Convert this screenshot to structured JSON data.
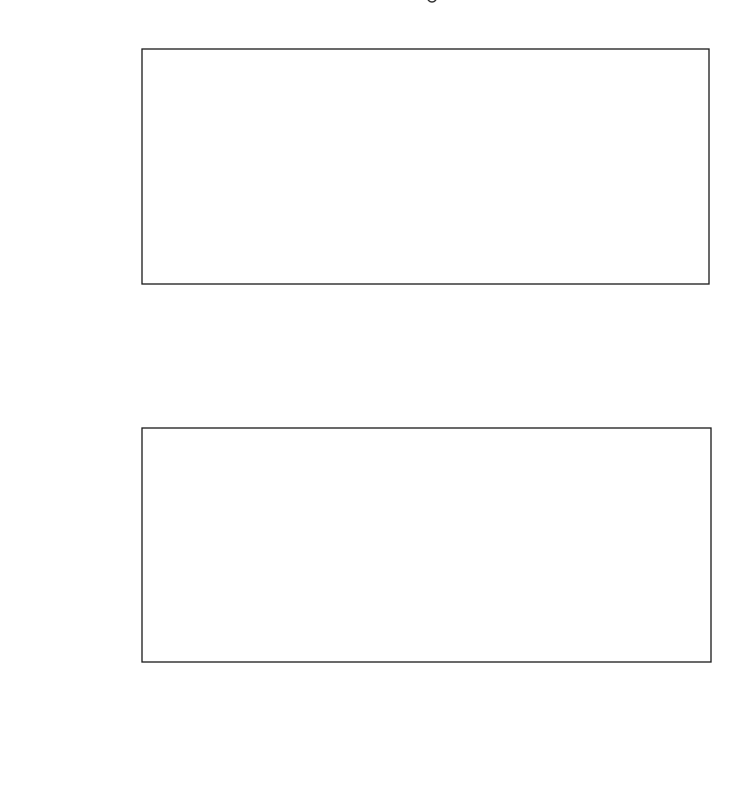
{
  "chart_data": [
    {
      "type": "line",
      "title": "",
      "xlabel": "generation",
      "ylabel": "fitness",
      "xlim": [
        0,
        200
      ],
      "ylim": [
        0,
        300
      ],
      "xticks": [
        0,
        50,
        100,
        150,
        200
      ],
      "yticks": [
        0,
        100,
        200,
        300
      ],
      "grid": false,
      "legend": null,
      "series": [
        {
          "name": "fitness",
          "x": [
            1,
            2,
            3,
            4,
            5,
            6,
            7,
            8,
            9,
            10,
            11,
            12,
            13,
            14,
            15,
            16,
            17,
            18,
            19,
            20,
            21,
            22,
            23,
            24,
            25,
            26,
            27,
            28,
            29,
            30,
            31,
            32,
            33,
            34,
            35,
            36,
            37,
            38,
            39,
            40,
            41,
            42,
            43,
            44,
            45,
            46,
            47,
            48,
            49,
            50,
            51,
            52,
            53,
            54,
            55,
            56,
            57,
            58,
            59,
            60,
            61,
            62,
            63,
            64,
            65,
            66,
            67,
            68,
            69,
            70,
            71,
            72,
            73,
            74,
            75,
            76,
            77,
            78,
            79,
            80,
            81,
            82,
            83,
            84,
            85,
            86,
            87,
            88,
            89,
            90,
            91,
            92,
            93,
            94,
            95,
            96,
            97,
            98,
            99,
            100,
            101,
            102,
            103,
            104,
            105,
            106,
            107,
            108,
            109,
            110,
            111,
            112,
            113,
            114,
            115,
            116,
            117,
            118,
            119,
            120,
            121,
            122,
            123,
            124,
            125,
            126,
            127,
            128,
            129,
            130,
            131,
            132,
            133,
            134,
            135,
            136,
            137,
            138,
            139,
            140,
            141,
            142,
            143,
            144,
            145,
            146,
            147,
            148,
            149,
            150,
            151,
            152,
            153,
            154,
            155,
            156,
            157,
            158,
            159,
            160,
            161,
            162,
            163,
            164,
            165,
            166,
            167,
            168,
            169,
            170,
            171,
            172,
            173,
            174,
            175,
            176,
            177,
            178,
            179,
            180,
            181,
            182,
            183,
            184,
            185,
            186,
            187,
            188,
            189,
            190,
            191,
            192,
            193,
            194,
            195,
            196,
            197,
            198,
            199,
            200
          ],
          "values": [
            15,
            22,
            22,
            10,
            10,
            15,
            17,
            17,
            17,
            22,
            25,
            35,
            25,
            260,
            295,
            295,
            295,
            295,
            295,
            35,
            35,
            32,
            40,
            48,
            42,
            52,
            185,
            40,
            40,
            155,
            110,
            40,
            40,
            40,
            35,
            297,
            295,
            45,
            45,
            178,
            148,
            148,
            148,
            148,
            22,
            22,
            25,
            150,
            158,
            158,
            158,
            30,
            85,
            85,
            85,
            85,
            85,
            72,
            152,
            152,
            35,
            40,
            40,
            40,
            40,
            30,
            97,
            30,
            30,
            30,
            28,
            25,
            30,
            197,
            30,
            27,
            40,
            25,
            30,
            30,
            35,
            30,
            28,
            30,
            25,
            20,
            20,
            28,
            25,
            30,
            25,
            30,
            22,
            25,
            30,
            28,
            30,
            38,
            32,
            30,
            35,
            28,
            25,
            32,
            30,
            28,
            32,
            30,
            28,
            25,
            35,
            40,
            30,
            38,
            32,
            20,
            38,
            40,
            100,
            15,
            40,
            165,
            165,
            115,
            115,
            20,
            20,
            25,
            15,
            15,
            15,
            15,
            15,
            20,
            32,
            15,
            20,
            15,
            20,
            20,
            20,
            20,
            30,
            30,
            187,
            25,
            15,
            15,
            15,
            15,
            12,
            42,
            10,
            20,
            25,
            25,
            25,
            25,
            30,
            75,
            20,
            222,
            30,
            72,
            35,
            30,
            28,
            35,
            25,
            25,
            30,
            30,
            28,
            35,
            60,
            25,
            35,
            30,
            180,
            120,
            110,
            110,
            92,
            160,
            160,
            160,
            145,
            140,
            80,
            80,
            50,
            90,
            65,
            65,
            65,
            68,
            162,
            52,
            52,
            145,
            110
          ]
        }
      ]
    },
    {
      "type": "scatter",
      "title": "",
      "xlabel": "X",
      "ylabel": "Y",
      "xlim": [
        0,
        10
      ],
      "ylim": [
        0,
        0.9
      ],
      "xticks": [
        0,
        2,
        4,
        6,
        8,
        10
      ],
      "yticks": [
        0.0,
        0.4,
        0.8
      ],
      "grid": false,
      "legend": null,
      "series": [
        {
          "name": "observed",
          "marker": "open-circle",
          "x": [
            0,
            0.5,
            1,
            1.5,
            2,
            2.5,
            3,
            3.5,
            4,
            4.5,
            5,
            5.5,
            6,
            6.5,
            7,
            7.5,
            8,
            8.5,
            9,
            9.5,
            10
          ],
          "values": [
            0.89,
            0.54,
            0.3,
            0.24,
            0.14,
            0.1,
            0.06,
            0.03,
            0.02,
            0.015,
            0.01,
            0.01,
            0.01,
            0.01,
            0.01,
            0.01,
            0.01,
            0.01,
            0.01,
            0.01,
            0.01
          ]
        },
        {
          "name": "fitted curve",
          "style": "dashed",
          "formula": "0.89 * exp(-0.97 x)",
          "x": [
            0,
            0.25,
            0.5,
            0.75,
            1,
            1.25,
            1.5,
            1.75,
            2,
            2.5,
            3,
            3.5,
            4,
            4.5,
            5,
            6,
            7,
            8,
            9,
            10
          ],
          "values": [
            0.89,
            0.7,
            0.55,
            0.43,
            0.34,
            0.27,
            0.21,
            0.16,
            0.13,
            0.08,
            0.05,
            0.03,
            0.02,
            0.012,
            0.01,
            0.01,
            0.01,
            0.01,
            0.01,
            0.01
          ]
        }
      ]
    }
  ],
  "top_chart": {
    "ylabel": "fitness",
    "xlabel": "generation",
    "xtick_labels": [
      "0",
      "50",
      "100",
      "150",
      "200"
    ],
    "ytick_labels": [
      "0",
      "100",
      "200",
      "300"
    ]
  },
  "bottom_chart": {
    "ylabel": "Y",
    "xlabel": "X",
    "xtick_labels": [
      "0",
      "2",
      "4",
      "6",
      "8",
      "10"
    ],
    "ytick_labels": [
      "0.0",
      "0.4",
      "0.8"
    ]
  },
  "colors": {
    "ink": "#1a1a1a",
    "background": "#ffffff"
  }
}
